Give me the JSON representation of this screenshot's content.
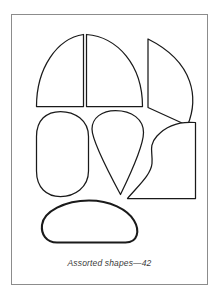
{
  "plate": {
    "caption": "Assorted shapes—42",
    "border_color": "#8c8c8c",
    "background_color": "#ffffff",
    "ink_color": "#1a1a1a",
    "shapes": [
      {
        "id": "quarter-circle-left",
        "name": "quarter-circle-left",
        "description": "quarter circle with flat bottom and flat right edge, curve sweeping from upper right to lower left"
      },
      {
        "id": "quarter-circle-center",
        "name": "quarter-circle-center",
        "description": "mirrored quarter circle with flat bottom and flat left edge, curve sweeping from upper left to lower right"
      },
      {
        "id": "curved-wedge-right",
        "name": "curved-wedge-right",
        "description": "curved wedge at upper right with straight left edge and arc on the right, bottom edge sloping down to the right"
      },
      {
        "id": "stadium-oval-left",
        "name": "stadium-oval-left",
        "description": "tall rounded rectangle / stadium oval at middle left"
      },
      {
        "id": "kite-teardrop-center",
        "name": "kite-teardrop-center",
        "description": "kite or teardrop with rounded broad top and a sharp point at the bottom"
      },
      {
        "id": "wavy-edge-polygon-right",
        "name": "wavy-edge-polygon-right",
        "description": "irregular shape with a wavy left contour, flat right edge and flat bottom edge"
      },
      {
        "id": "rounded-blob-bottom",
        "name": "rounded-blob-bottom",
        "description": "wide rounded blob / pebble shape across the bottom, drawn with a heavier outline"
      }
    ]
  }
}
